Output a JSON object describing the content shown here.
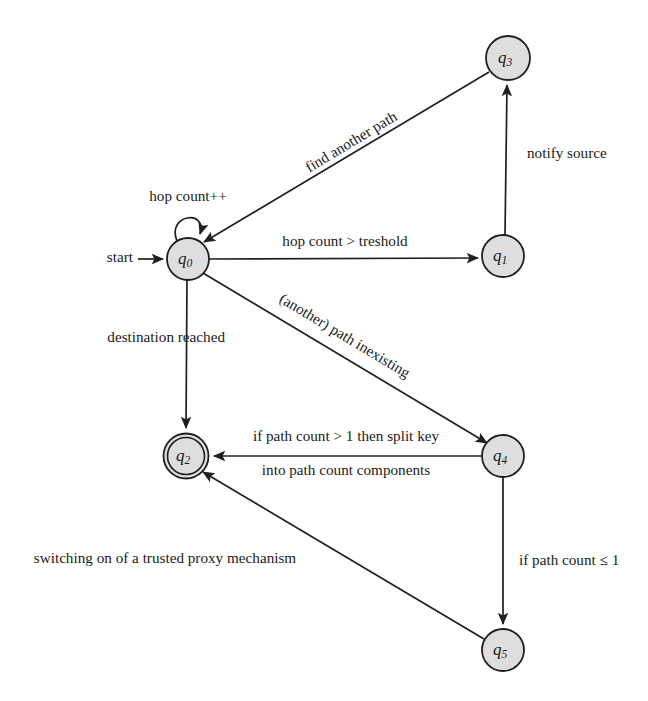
{
  "diagram": {
    "type": "finite-state-automaton",
    "start_label": "start",
    "background_color": "#ffffff",
    "node_fill_color": "#dedede",
    "stroke_color": "#1f1f1f",
    "states": [
      {
        "id": "q0",
        "label": "q",
        "subscript": "0",
        "cx": 188,
        "cy": 259,
        "r": 21,
        "accepting": false,
        "initial": true
      },
      {
        "id": "q1",
        "label": "q",
        "subscript": "1",
        "cx": 503,
        "cy": 256,
        "r": 21,
        "accepting": false,
        "initial": false
      },
      {
        "id": "q2",
        "label": "q",
        "subscript": "2",
        "cx": 186,
        "cy": 456,
        "r": 22,
        "accepting": true,
        "initial": false
      },
      {
        "id": "q3",
        "label": "q",
        "subscript": "3",
        "cx": 508,
        "cy": 58,
        "r": 22,
        "accepting": false,
        "initial": false
      },
      {
        "id": "q4",
        "label": "q",
        "subscript": "4",
        "cx": 503,
        "cy": 456,
        "r": 21,
        "accepting": false,
        "initial": false
      },
      {
        "id": "q5",
        "label": "q",
        "subscript": "5",
        "cx": 503,
        "cy": 650,
        "r": 21,
        "accepting": false,
        "initial": false
      }
    ],
    "transitions": [
      {
        "id": "t-self-q0",
        "from": "q0",
        "to": "q0",
        "label": "hop count++",
        "label_x": 188,
        "label_y": 198,
        "rotation": 0,
        "shape": "self-loop"
      },
      {
        "id": "t-q0-q1",
        "from": "q0",
        "to": "q1",
        "label": "hop count > treshold",
        "label_x": 345,
        "label_y": 243,
        "rotation": 0,
        "shape": "straight"
      },
      {
        "id": "t-q1-q3",
        "from": "q1",
        "to": "q3",
        "label": "notify source",
        "label_x": 555,
        "label_y": 155,
        "rotation": 0,
        "shape": "straight"
      },
      {
        "id": "t-q3-q0",
        "from": "q3",
        "to": "q0",
        "label": "find another path",
        "label_x": 352,
        "label_y": 143,
        "rotation": -33,
        "shape": "straight"
      },
      {
        "id": "t-q0-q4",
        "from": "q0",
        "to": "q4",
        "label": "(another) path inexisting",
        "label_x": 344,
        "label_y": 337,
        "rotation": 32,
        "shape": "straight"
      },
      {
        "id": "t-q0-q2",
        "from": "q0",
        "to": "q2",
        "label": "destination reached",
        "label_x": 158,
        "label_y": 339,
        "rotation": 0,
        "shape": "straight"
      },
      {
        "id": "t-q4-q2",
        "from": "q4",
        "to": "q2",
        "label_line1": "if path count > 1 then split key",
        "label_line2": "into path count components",
        "label_x": 345,
        "label_y": 439,
        "label2_y": 472,
        "rotation": 0,
        "shape": "straight"
      },
      {
        "id": "t-q4-q5",
        "from": "q4",
        "to": "q5",
        "label": "if path count ≤ 1",
        "label_x": 520,
        "label_y": 562,
        "rotation": 0,
        "shape": "straight"
      },
      {
        "id": "t-q5-q2",
        "from": "q5",
        "to": "q2",
        "label": "switching on of a trusted proxy mechanism",
        "label_x": 165,
        "label_y": 560,
        "rotation": 0,
        "shape": "straight"
      }
    ]
  }
}
